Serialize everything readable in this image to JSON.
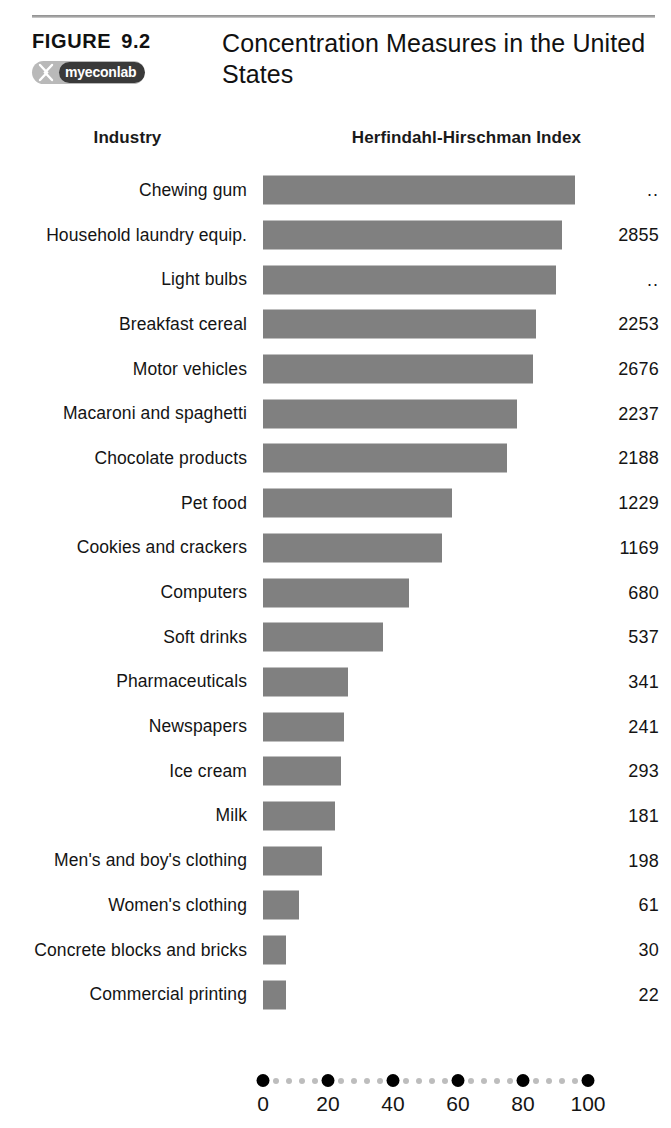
{
  "figure": {
    "label": "FIGURE",
    "number": "9.2",
    "title": "Concentration Measures in the United States",
    "badge": {
      "icon": "myeconlab-x-icon",
      "text_my": "my",
      "text_econ": "econ",
      "text_lab": "lab",
      "full_text": "myeconlab"
    }
  },
  "columns": {
    "industry_header": "Industry",
    "hhi_header": "Herfindahl-Hirschman Index"
  },
  "chart_data": {
    "type": "bar",
    "orientation": "horizontal",
    "title": "Concentration Measures in the United States",
    "xlabel": "",
    "ylabel": "Industry",
    "xlim": [
      0,
      100
    ],
    "xticks": [
      0,
      20,
      40,
      60,
      80,
      100
    ],
    "xtick_labels": [
      "0",
      "20",
      "40",
      "60",
      "80",
      "100"
    ],
    "minor_ticks_per_interval": 4,
    "grid": false,
    "legend": null,
    "bar_color": "#808080",
    "series_name": "Four-firm concentration ratio (percent)",
    "categories": [
      "Chewing gum",
      "Household laundry equip.",
      "Light bulbs",
      "Breakfast cereal",
      "Motor vehicles",
      "Macaroni and spaghetti",
      "Chocolate products",
      "Pet food",
      "Cookies and crackers",
      "Computers",
      "Soft drinks",
      "Pharmaceuticals",
      "Newspapers",
      "Ice cream",
      "Milk",
      "Men's and boy's clothing",
      "Women's clothing",
      "Concrete blocks and bricks",
      "Commercial printing"
    ],
    "values": [
      96,
      92,
      90,
      84,
      83,
      78,
      75,
      58,
      55,
      45,
      37,
      26,
      25,
      24,
      22,
      18,
      11,
      7,
      7
    ],
    "hhi_labels": [
      "..",
      "2855",
      "..",
      "2253",
      "2676",
      "2237",
      "2188",
      "1229",
      "1169",
      "680",
      "537",
      "341",
      "241",
      "293",
      "181",
      "198",
      "61",
      "30",
      "22"
    ],
    "rows": [
      {
        "industry": "Chewing gum",
        "bar": 96,
        "hhi": ".."
      },
      {
        "industry": "Household laundry equip.",
        "bar": 92,
        "hhi": "2855"
      },
      {
        "industry": "Light bulbs",
        "bar": 90,
        "hhi": ".."
      },
      {
        "industry": "Breakfast cereal",
        "bar": 84,
        "hhi": "2253"
      },
      {
        "industry": "Motor vehicles",
        "bar": 83,
        "hhi": "2676"
      },
      {
        "industry": "Macaroni and spaghetti",
        "bar": 78,
        "hhi": "2237"
      },
      {
        "industry": "Chocolate products",
        "bar": 75,
        "hhi": "2188"
      },
      {
        "industry": "Pet food",
        "bar": 58,
        "hhi": "1229"
      },
      {
        "industry": "Cookies and crackers",
        "bar": 55,
        "hhi": "1169"
      },
      {
        "industry": "Computers",
        "bar": 45,
        "hhi": "680"
      },
      {
        "industry": "Soft drinks",
        "bar": 37,
        "hhi": "537"
      },
      {
        "industry": "Pharmaceuticals",
        "bar": 26,
        "hhi": "341"
      },
      {
        "industry": "Newspapers",
        "bar": 25,
        "hhi": "241"
      },
      {
        "industry": "Ice cream",
        "bar": 24,
        "hhi": "293"
      },
      {
        "industry": "Milk",
        "bar": 22,
        "hhi": "181"
      },
      {
        "industry": "Men's and boy's clothing",
        "bar": 18,
        "hhi": "198"
      },
      {
        "industry": "Women's clothing",
        "bar": 11,
        "hhi": "61"
      },
      {
        "industry": "Concrete blocks and bricks",
        "bar": 7,
        "hhi": "30"
      },
      {
        "industry": "Commercial printing",
        "bar": 7,
        "hhi": "22"
      }
    ]
  },
  "colors": {
    "bar": "#808080",
    "axis_major_dot": "#000000",
    "axis_minor_dot": "#bdbdbd",
    "rule": "#9a9a9a",
    "badge_light": "#b9b9b9",
    "badge_dark": "#3a3a3a",
    "text": "#141414"
  }
}
